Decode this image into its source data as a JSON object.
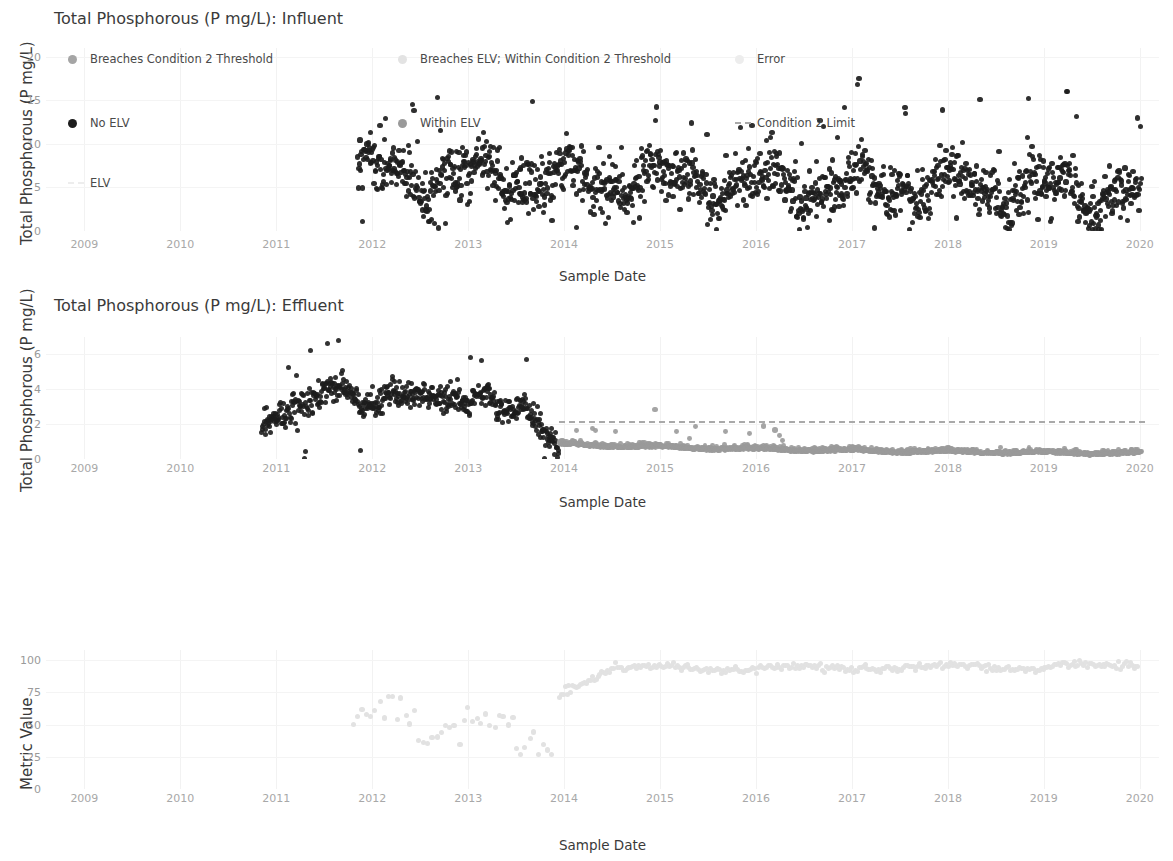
{
  "colors": {
    "no_elv": "#1d1d1d",
    "within_elv": "#9a9a9a",
    "breaches_condition2": "#a5a5a5",
    "breaches_elv_within_condition2": "#e3e3e3",
    "error": "#ededed",
    "condition2_limit": "#a9a9a9",
    "elv_line": "#ededed",
    "metric": "#e2e2e2",
    "grid": "#f2f2f2",
    "tick_text": "#a8a8a8",
    "title_text": "#3a3a3a"
  },
  "panels": [
    {
      "id": "influent",
      "title": "Total Phosphorous (P mg/L): Influent",
      "ylabel": "Total Phosphorous (P mg/L)",
      "xlabel": "Sample Date",
      "yticks": [
        0,
        5,
        10,
        15,
        20
      ],
      "xticks": [
        "2009",
        "2010",
        "2011",
        "2012",
        "2013",
        "2014",
        "2015",
        "2016",
        "2017",
        "2018",
        "2019",
        "2020"
      ]
    },
    {
      "id": "effluent",
      "title": "Total Phosphorous (P mg/L): Effluent",
      "ylabel": "Total Phosphorous (P mg/L)",
      "xlabel": "Sample Date",
      "yticks": [
        0,
        2,
        4,
        6
      ],
      "xticks": [
        "2009",
        "2010",
        "2011",
        "2012",
        "2013",
        "2014",
        "2015",
        "2016",
        "2017",
        "2018",
        "2019",
        "2020"
      ]
    },
    {
      "id": "metric",
      "title": "",
      "ylabel": "Metric Value",
      "xlabel": "Sample Date",
      "yticks": [
        0,
        25,
        50,
        75,
        100
      ],
      "xticks": [
        "2009",
        "2010",
        "2011",
        "2012",
        "2013",
        "2014",
        "2015",
        "2016",
        "2017",
        "2018",
        "2019",
        "2020"
      ]
    }
  ],
  "legend": {
    "items": [
      {
        "label": "Breaches Condition 2 Threshold",
        "marker": "dot",
        "color": "#a5a5a5",
        "col": 0,
        "row": 0
      },
      {
        "label": "Breaches ELV; Within Condition 2 Threshold",
        "marker": "dot",
        "color": "#e3e3e3",
        "col": 1,
        "row": 0
      },
      {
        "label": "Error",
        "marker": "dot",
        "color": "#ededed",
        "col": 2,
        "row": 0
      },
      {
        "label": "No ELV",
        "marker": "dot",
        "color": "#1d1d1d",
        "col": 0,
        "row": 1
      },
      {
        "label": "Within ELV",
        "marker": "dot",
        "color": "#9a9a9a",
        "col": 1,
        "row": 1
      },
      {
        "label": "Condition 2 Limit",
        "marker": "dash",
        "color": "#a9a9a9",
        "col": 2,
        "row": 1
      },
      {
        "label": "ELV",
        "marker": "dash",
        "color": "#ededed",
        "col": 0,
        "row": 2
      }
    ]
  },
  "chart_data": [
    {
      "type": "scatter",
      "title": "Total Phosphorous (P mg/L): Influent",
      "xlabel": "Sample Date",
      "ylabel": "Total Phosphorous (P mg/L)",
      "xlim": [
        2008.6,
        2020.2
      ],
      "ylim": [
        0,
        21
      ],
      "yticks": [
        0,
        5,
        10,
        15,
        20
      ],
      "xticks": [
        2009,
        2010,
        2011,
        2012,
        2013,
        2014,
        2015,
        2016,
        2017,
        2018,
        2019,
        2020
      ],
      "grid": true,
      "legend_position": "below-second-panel",
      "series": [
        {
          "name": "No ELV",
          "color": "#1d1d1d",
          "x_range": [
            2011.85,
            2020.02
          ],
          "n_points": 1450,
          "mean": 6.6,
          "band": [
            3.2,
            10.5
          ],
          "notes": "Dense daily scatter starting late 2011; baseline ~5-8 mg/L with frequent spikes to 12-16 and isolated maxima near 19-20 (mid-2012, late-2013, mid-2017, mid-2019); rare low outliers near 0-1 (2012, 2016)."
        }
      ]
    },
    {
      "type": "scatter",
      "title": "Total Phosphorous (P mg/L): Effluent",
      "xlabel": "Sample Date",
      "ylabel": "Total Phosphorous (P mg/L)",
      "xlim": [
        2008.6,
        2020.2
      ],
      "ylim": [
        0,
        7
      ],
      "yticks": [
        0,
        2,
        4,
        6
      ],
      "xticks": [
        2009,
        2010,
        2011,
        2012,
        2013,
        2014,
        2015,
        2016,
        2017,
        2018,
        2019,
        2020
      ],
      "grid": true,
      "legend_position": "below",
      "series": [
        {
          "name": "No ELV",
          "color": "#1d1d1d",
          "x_range": [
            2010.85,
            2013.95
          ],
          "n_points": 520,
          "notes": "Begins ~2.0 at end of 2010, rises to a plateau of 3.5-4.5 through 2011-2012, drifts to ~2.5-3.5 in 2013 then falls sharply to <1 by early 2014. Outliers at ~6.1 (mid-2012) and ~6.6 (mid-2013); low outliers near 0 in 2012 and 2013."
        },
        {
          "name": "Within ELV",
          "color": "#9a9a9a",
          "x_range": [
            2013.95,
            2020.02
          ],
          "n_points": 1400,
          "mean": 0.35,
          "notes": "Low flat band declining from ~0.7 in early 2014 to ~0.15 by 2019-2020, with scattered points up to 1.5 in 2014-2015."
        },
        {
          "name": "Breaches Condition 2 Threshold",
          "color": "#a5a5a5",
          "points": [
            [
              2014.95,
              2.85
            ],
            [
              2016.08,
              1.9
            ],
            [
              2016.2,
              1.65
            ]
          ],
          "notes": "A handful of grey markers above the Condition 2 limit line."
        },
        {
          "name": "Condition 2 Limit",
          "type": "hline-dashed",
          "color": "#a9a9a9",
          "value": 2.2,
          "x_range": [
            2013.95,
            2020.05
          ]
        }
      ]
    },
    {
      "type": "scatter",
      "title": "",
      "xlabel": "Sample Date",
      "ylabel": "Metric Value",
      "xlim": [
        2008.6,
        2020.2
      ],
      "ylim": [
        0,
        108
      ],
      "yticks": [
        0,
        25,
        50,
        75,
        100
      ],
      "xticks": [
        2009,
        2010,
        2011,
        2012,
        2013,
        2014,
        2015,
        2016,
        2017,
        2018,
        2019,
        2020
      ],
      "grid": true,
      "series": [
        {
          "name": "Metric Value",
          "color": "#e2e2e2",
          "x_range": [
            2011.8,
            2020.0
          ],
          "n_points": 330,
          "notes": "Sparse scattered values 30-65 through 2012-mid 2013 (min ~28 late 2013), rising steeply across 2014 from ~70 to ~95, then a dense near-continuous band holding 90-97 from mid-2014 through 2020."
        }
      ]
    }
  ]
}
